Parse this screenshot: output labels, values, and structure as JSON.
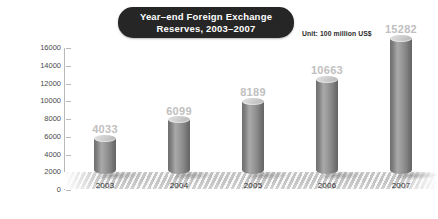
{
  "chart_data": {
    "type": "bar",
    "title": "Year–end Foreign Exchange Reserves, 2003–2007",
    "title_lines": [
      "Year–end Foreign Exchange",
      "Reserves, 2003–2007"
    ],
    "unit_note": "Unit: 100 million US$",
    "categories": [
      "2003",
      "2004",
      "2005",
      "2006",
      "2007"
    ],
    "values": [
      4033,
      6099,
      8189,
      10663,
      15282
    ],
    "value_labels": [
      "4033",
      "6099",
      "8189",
      "10663",
      "15282"
    ],
    "xlabel": "",
    "ylabel": "",
    "ylim": [
      0,
      16000
    ],
    "ytick_step": 2000,
    "yticks": [
      "16000",
      "14000",
      "12000",
      "10000",
      "8000",
      "6000",
      "4000",
      "2000",
      "0"
    ],
    "grid": false,
    "legend": false,
    "style": "3d-cylinder",
    "colors": {
      "title_pill_background": "#262626",
      "title_text": "#ffffff",
      "unit_text": "#2b2b2b",
      "value_label": "#c0c0c0",
      "axis_line": "#b9b9b9",
      "tick_label": "#4a4a4a",
      "category_label": "#2f2f2f",
      "bar_light": "#a9a9a9",
      "bar_dark": "#656565",
      "bar_top": "#d8d8d8",
      "floor": "#c4c4c4",
      "background": "#ffffff"
    }
  }
}
